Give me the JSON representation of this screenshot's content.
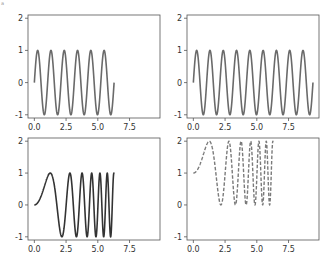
{
  "figure": {
    "width": 331,
    "height": 269,
    "corner_mark": "a"
  },
  "chart_data": [
    {
      "type": "line",
      "position": "top-left",
      "title": "",
      "xlabel": "",
      "ylabel": "",
      "function": "sin(6x)",
      "x_range": [
        0,
        6.283
      ],
      "xlim": [
        -0.5,
        9.9
      ],
      "ylim": [
        -1.1,
        2.1
      ],
      "xticks": [
        0,
        2.5,
        5,
        7.5
      ],
      "xtick_labels": [
        "0.0",
        "2.5",
        "5.0",
        "7.5"
      ],
      "yticks": [
        -1,
        0,
        1,
        2
      ],
      "ytick_labels": [
        "-1",
        "0",
        "1",
        "2"
      ],
      "line_color": "#6a6a6a",
      "line_style": "solid",
      "line_width": 1.6,
      "grid": false
    },
    {
      "type": "line",
      "position": "top-right",
      "title": "",
      "xlabel": "",
      "ylabel": "",
      "function": "sin(6x)",
      "x_range": [
        0,
        9.425
      ],
      "xlim": [
        -0.5,
        9.9
      ],
      "ylim": [
        -1.1,
        2.1
      ],
      "xticks": [
        0,
        2.5,
        5,
        7.5
      ],
      "xtick_labels": [
        "0.0",
        "2.5",
        "5.0",
        "7.5"
      ],
      "yticks": [
        -1,
        0,
        1,
        2
      ],
      "ytick_labels": [
        "-1",
        "0",
        "1",
        "2"
      ],
      "line_color": "#6a6a6a",
      "line_style": "solid",
      "line_width": 1.6,
      "grid": false
    },
    {
      "type": "line",
      "position": "bottom-left",
      "title": "",
      "xlabel": "",
      "ylabel": "",
      "function": "sin(x^2)",
      "x_range": [
        0,
        6.283
      ],
      "xlim": [
        -0.5,
        9.9
      ],
      "ylim": [
        -1.1,
        2.1
      ],
      "xticks": [
        0,
        2.5,
        5,
        7.5
      ],
      "xtick_labels": [
        "0.0",
        "2.5",
        "5.0",
        "7.5"
      ],
      "yticks": [
        -1,
        0,
        1,
        2
      ],
      "ytick_labels": [
        "-1",
        "0",
        "1",
        "2"
      ],
      "line_color": "#333333",
      "line_style": "solid",
      "line_width": 1.6,
      "grid": false
    },
    {
      "type": "line",
      "position": "bottom-right",
      "title": "",
      "xlabel": "",
      "ylabel": "",
      "function": "sin(x^2) + 1",
      "x_range": [
        0,
        6.283
      ],
      "xlim": [
        -0.5,
        9.9
      ],
      "ylim": [
        -1.1,
        2.1
      ],
      "xticks": [
        0,
        2.5,
        5,
        7.5
      ],
      "xtick_labels": [
        "0.0",
        "2.5",
        "5.0",
        "7.5"
      ],
      "yticks": [
        -1,
        0,
        1,
        2
      ],
      "ytick_labels": [
        "-1",
        "0",
        "1",
        "2"
      ],
      "line_color": "#7a7a7a",
      "line_style": "dashed",
      "line_width": 1.4,
      "grid": false
    }
  ],
  "layout": {
    "axes": [
      {
        "left": 28,
        "top": 15,
        "right": 160,
        "bottom": 118
      },
      {
        "left": 187,
        "top": 15,
        "right": 319,
        "bottom": 118
      },
      {
        "left": 28,
        "top": 138,
        "right": 160,
        "bottom": 240
      },
      {
        "left": 187,
        "top": 138,
        "right": 319,
        "bottom": 240
      }
    ]
  }
}
